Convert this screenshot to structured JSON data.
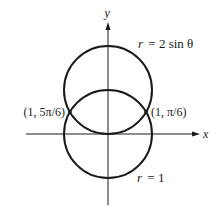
{
  "figure": {
    "axes": {
      "x_label": "x",
      "y_label": "y"
    },
    "curves": [
      {
        "name": "r = 2 sin θ",
        "label_lhs": "r",
        "label_rhs": "= 2 sin θ",
        "label": "r = 2 sin θ"
      },
      {
        "name": "r = 1",
        "label_lhs": "r",
        "label_rhs": "= 1",
        "label": "r = 1"
      }
    ],
    "intersections": [
      {
        "label": "(1, 5π/6)",
        "position": "left"
      },
      {
        "label": "(1, π/6)",
        "position": "right"
      }
    ],
    "colors": {
      "stroke": "#1a1a1a",
      "background": "#ffffff"
    }
  }
}
